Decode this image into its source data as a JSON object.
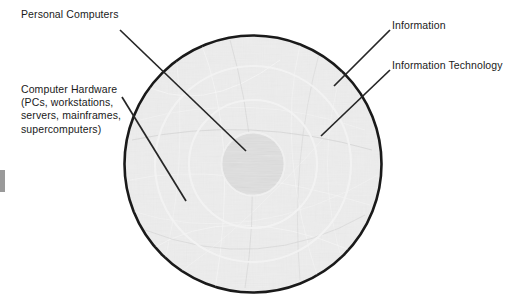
{
  "diagram": {
    "type": "concentric-rings",
    "background_color": "#ffffff",
    "outline_color": "#1a1a1a",
    "ring_line_color": "#ffffff",
    "fill_color": "#c8c8c8",
    "center_fill_color": "#b4b4b4",
    "text_color": "#1a1a1a",
    "center": {
      "x": 253,
      "y": 164
    },
    "radii": {
      "core": 32,
      "ring1": 64,
      "ring2": 98,
      "outer": 129
    },
    "labels": {
      "personal_computers": "Personal Computers",
      "computer_hardware_line1": "Computer Hardware",
      "computer_hardware_line2": "(PCs, workstations,",
      "computer_hardware_line3": "servers, mainframes,",
      "computer_hardware_line4": "supercomputers)",
      "information": "Information",
      "information_technology": "Information Technology"
    },
    "leaders": [
      {
        "name": "personal-computers-leader",
        "x1": 120,
        "y1": 30,
        "x2": 246,
        "y2": 151
      },
      {
        "name": "computer-hardware-leader",
        "x1": 122,
        "y1": 97,
        "x2": 186,
        "y2": 201
      },
      {
        "name": "information-leader",
        "x1": 390,
        "y1": 30,
        "x2": 334,
        "y2": 86
      },
      {
        "name": "information-technology-leader",
        "x1": 390,
        "y1": 70,
        "x2": 321,
        "y2": 136
      }
    ]
  }
}
